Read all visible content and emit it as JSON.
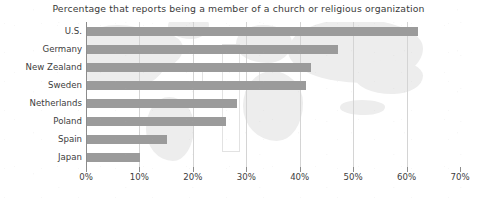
{
  "chart_data": {
    "type": "bar",
    "orientation": "horizontal",
    "title": "Percentage that reports being a member of a church or religious organization",
    "xlabel": "",
    "ylabel": "",
    "categories": [
      "U.S.",
      "Germany",
      "New Zealand",
      "Sweden",
      "Netherlands",
      "Poland",
      "Spain",
      "Japan"
    ],
    "values": [
      62,
      47,
      42,
      41,
      28,
      26,
      15,
      10
    ],
    "xlim": [
      0,
      70
    ],
    "xticks": [
      0,
      10,
      20,
      30,
      40,
      50,
      60,
      70
    ],
    "xtick_labels": [
      "0%",
      "10%",
      "20%",
      "30%",
      "40%",
      "50%",
      "60%",
      "70%"
    ],
    "grid": true,
    "legend": "none",
    "bar_color": "#9b9b9b",
    "gridline_color": "#d4d4d4",
    "axis_color": "#8c8c8c",
    "background_watermark": [
      "world-map",
      "christian-cross"
    ]
  }
}
